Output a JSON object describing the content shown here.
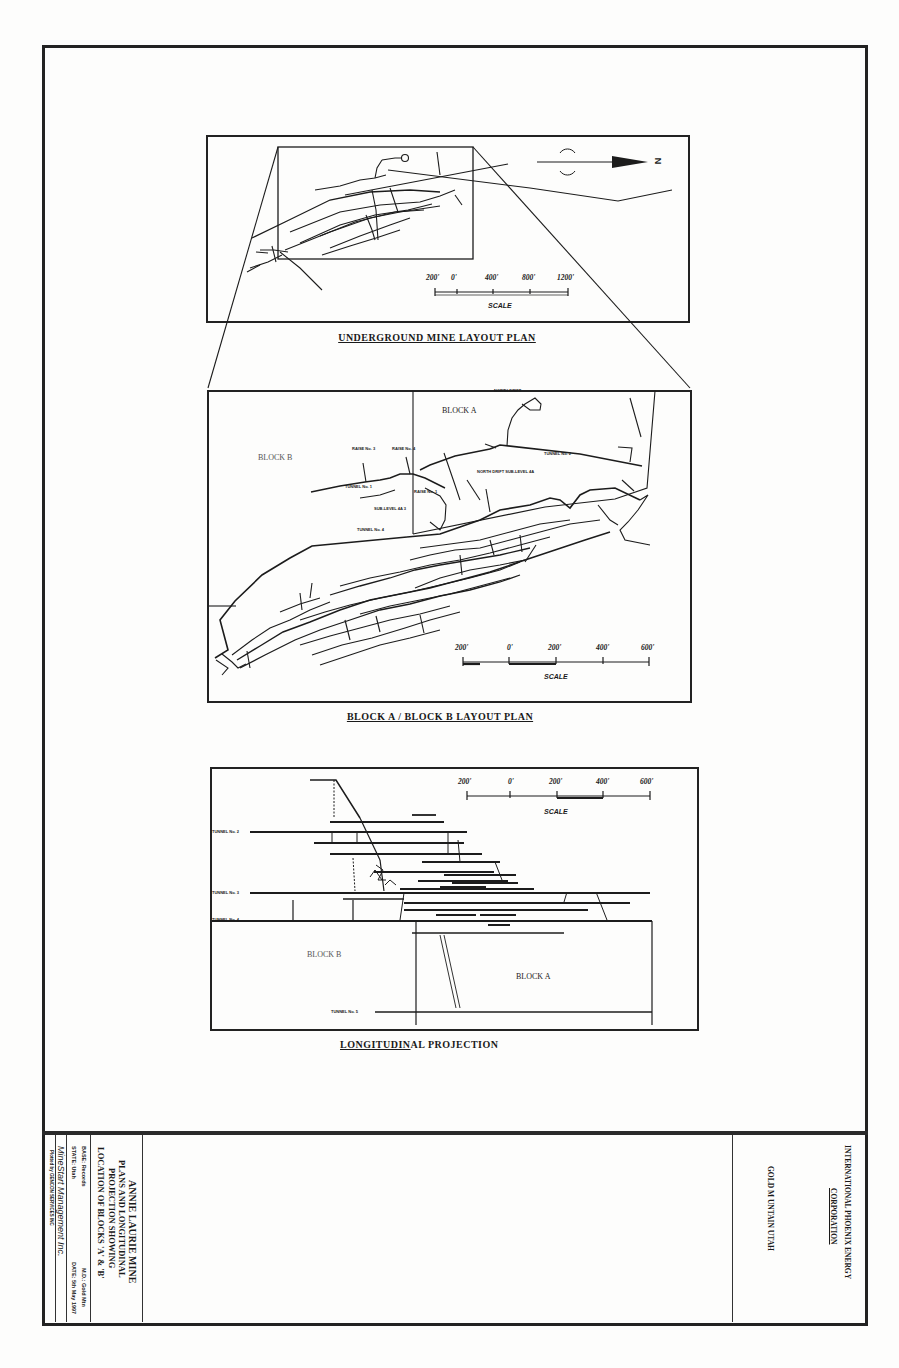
{
  "document": {
    "type": "mine plan drawing (scanned, rotated title block)"
  },
  "panels": {
    "underground_plan": {
      "title": "UNDERGROUND MINE LAYOUT PLAN",
      "north_label": "N",
      "scale": {
        "ticks": [
          "200'",
          "0'",
          "400'",
          "800'",
          "1200'"
        ],
        "label": "SCALE"
      }
    },
    "block_plan": {
      "title": "BLOCK A / BLOCK B LAYOUT PLAN",
      "block_a_label": "BLOCK A",
      "block_b_label": "BLOCK B",
      "labels": {
        "north_drift": "NORTH DRIFT",
        "raise3": "RAISE No. 3",
        "raise4": "RAISE No. 4",
        "tunnel1": "TUNNEL No. 1",
        "tunnel2": "TUNNEL No. 2",
        "raise1": "RAISE No. 1",
        "sublevel": "SUB-LEVEL 4A 3",
        "tunnel4": "TUNNEL No. 4",
        "north_drift_sub": "NORTH DRIFT SUB-LEVEL 4A"
      },
      "scale": {
        "ticks": [
          "200'",
          "0'",
          "200'",
          "400'",
          "600'"
        ],
        "label": "SCALE"
      }
    },
    "longitudinal": {
      "title_underlined": "LONGITUDIN",
      "title_rest": "AL PROJECTION",
      "block_a_label": "BLOCK A",
      "block_b_label": "BLOCK B",
      "tunnels": [
        "TUNNEL No. 2",
        "TUNNEL No. 3",
        "TUNNEL No. 4",
        "TUNNEL No. 5"
      ],
      "scale": {
        "ticks": [
          "200'",
          "0'",
          "200'",
          "400'",
          "600'"
        ],
        "label": "SCALE"
      }
    }
  },
  "title_block": {
    "project_lines": [
      "ANNIE LAURIE MINE",
      "PLANS AND LONGITUDINAL",
      "PROJECTION SHOWING",
      "LOCATION OF BLOCKS 'A' & 'B'"
    ],
    "base": "BASE: Records",
    "md": "M.D.: Gold Mtn",
    "state": "STATE: Utah",
    "date": "DATE: 5th May 1997",
    "company_sig": "MineStart Management Inc.",
    "plotted_by": "Plotted by GENCON SERVICES INC",
    "client_line1": "INTERNATIONAL PHOENIX ENERGY",
    "client_line2": "CORPORATION",
    "location": "GOLD M UNTAIN  UTAH"
  }
}
